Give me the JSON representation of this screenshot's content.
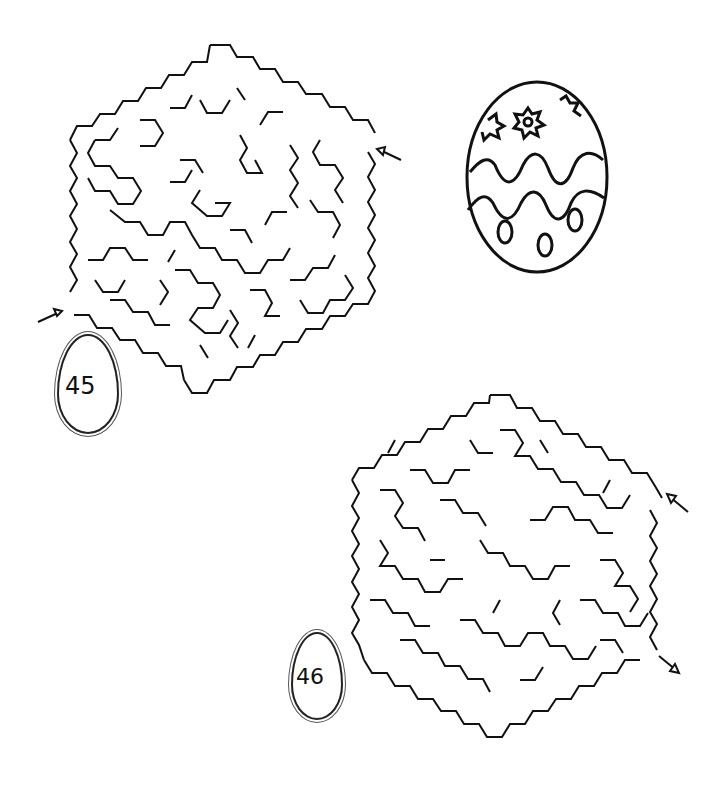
{
  "page": {
    "background": "#ffffff",
    "ink": "#111111"
  },
  "puzzles": [
    {
      "number": "45",
      "shape": "hexagon-maze",
      "entry_arrow": "left",
      "exit_arrow": "right-top"
    },
    {
      "number": "46",
      "shape": "hexagon-maze",
      "entry_arrow": "right-top",
      "exit_arrow": "right-bottom"
    }
  ],
  "decoration": {
    "name": "easter-egg-drawing",
    "patterns": [
      "flowers",
      "wavy-lines",
      "ovals"
    ]
  }
}
